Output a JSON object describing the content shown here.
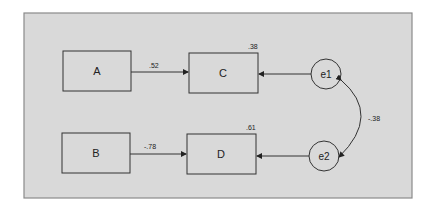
{
  "diagram": {
    "type": "path-diagram",
    "nodes": [
      {
        "id": "A",
        "label": "A",
        "shape": "rect"
      },
      {
        "id": "B",
        "label": "B",
        "shape": "rect"
      },
      {
        "id": "C",
        "label": "C",
        "shape": "rect",
        "r2": ".38"
      },
      {
        "id": "D",
        "label": "D",
        "shape": "rect",
        "r2": ".61"
      },
      {
        "id": "e1",
        "label": "e1",
        "shape": "circle"
      },
      {
        "id": "e2",
        "label": "e2",
        "shape": "circle"
      }
    ],
    "edges": [
      {
        "from": "A",
        "to": "C",
        "label": ".52"
      },
      {
        "from": "B",
        "to": "D",
        "label": "-.78"
      },
      {
        "from": "e1",
        "to": "C",
        "label": ""
      },
      {
        "from": "e2",
        "to": "D",
        "label": ""
      },
      {
        "from": "e1",
        "to": "e2",
        "label": "-.38",
        "type": "covariance"
      }
    ],
    "colors": {
      "panel": "#d9d9d9",
      "border": "#888888",
      "stroke": "#333333"
    }
  }
}
